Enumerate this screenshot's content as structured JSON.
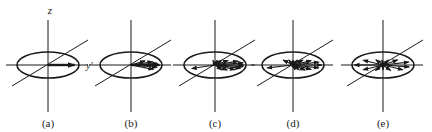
{
  "figure": {
    "axis_labels": {
      "z": "z",
      "y": "y'"
    },
    "line_color": "#1a1a1a",
    "panels": [
      {
        "id": "a",
        "caption": "(a)",
        "cx": 48,
        "description": "single magnetization vector along y'",
        "arrows": [
          {
            "angle": 0,
            "len": 28,
            "bold": true
          }
        ]
      },
      {
        "id": "b",
        "caption": "(b)",
        "cx": 131,
        "description": "vectors beginning to fan out (dephasing)",
        "arrows": [
          {
            "angle": -25,
            "len": 26
          },
          {
            "angle": -12,
            "len": 28
          },
          {
            "angle": 0,
            "len": 30,
            "bold": true
          },
          {
            "angle": 8,
            "len": 28
          },
          {
            "angle": 20,
            "len": 24
          },
          {
            "angle": 35,
            "len": 18
          }
        ]
      },
      {
        "id": "c",
        "caption": "(c)",
        "cx": 215,
        "description": "vectors spread over wider arc",
        "arrows": [
          {
            "angle": -160,
            "len": 26
          },
          {
            "angle": -60,
            "len": 14
          },
          {
            "angle": -45,
            "len": 18
          },
          {
            "angle": -30,
            "len": 24
          },
          {
            "angle": -18,
            "len": 28
          },
          {
            "angle": -8,
            "len": 30
          },
          {
            "angle": 0,
            "len": 30
          },
          {
            "angle": 10,
            "len": 30
          },
          {
            "angle": 22,
            "len": 26
          },
          {
            "angle": 40,
            "len": 18
          },
          {
            "angle": 60,
            "len": 14
          },
          {
            "angle": 80,
            "len": 12
          },
          {
            "angle": 100,
            "len": 12
          }
        ]
      },
      {
        "id": "d",
        "caption": "(d)",
        "cx": 293,
        "description": "vectors nearly fully dispersed",
        "arrows": [
          {
            "angle": -165,
            "len": 28
          },
          {
            "angle": -80,
            "len": 12
          },
          {
            "angle": -62,
            "len": 14
          },
          {
            "angle": -45,
            "len": 18
          },
          {
            "angle": -30,
            "len": 22
          },
          {
            "angle": -15,
            "len": 28
          },
          {
            "angle": 0,
            "len": 30
          },
          {
            "angle": 15,
            "len": 28
          },
          {
            "angle": 30,
            "len": 22
          },
          {
            "angle": 50,
            "len": 16
          },
          {
            "angle": 70,
            "len": 13
          },
          {
            "angle": 90,
            "len": 12
          },
          {
            "angle": 110,
            "len": 13
          },
          {
            "angle": 130,
            "len": 16
          }
        ]
      },
      {
        "id": "e",
        "caption": "(e)",
        "cx": 383,
        "description": "vectors uniformly distributed (complete dephasing)",
        "arrows": [
          {
            "angle": 180,
            "len": 30
          },
          {
            "angle": -150,
            "len": 24
          },
          {
            "angle": -120,
            "len": 16
          },
          {
            "angle": -90,
            "len": 12
          },
          {
            "angle": -60,
            "len": 16
          },
          {
            "angle": -30,
            "len": 24
          },
          {
            "angle": -10,
            "len": 28
          },
          {
            "angle": 15,
            "len": 28
          },
          {
            "angle": 40,
            "len": 20
          },
          {
            "angle": 65,
            "len": 14
          },
          {
            "angle": 95,
            "len": 12
          },
          {
            "angle": 120,
            "len": 15
          },
          {
            "angle": 150,
            "len": 24
          }
        ]
      }
    ]
  }
}
